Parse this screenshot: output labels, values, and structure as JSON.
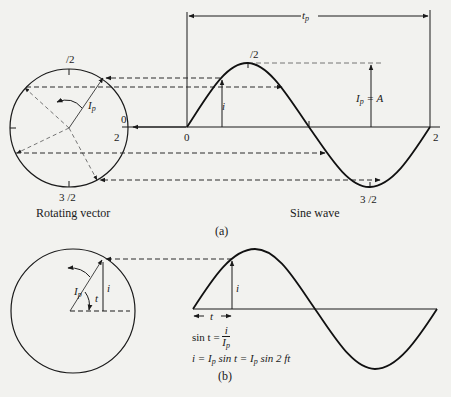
{
  "figure_a": {
    "period_label": "t",
    "period_sub": "p",
    "circle_top": "/2",
    "circle_right_top": "0",
    "circle_right_bottom": "2",
    "circle_bottom": "3 /2",
    "vector_label": "I",
    "vector_sub": "p",
    "wave_peak": "/2",
    "wave_origin": "0",
    "wave_end": "2",
    "wave_trough": "3 /2",
    "instant_label": "i",
    "amplitude_label_main": "I",
    "amplitude_label_sub": "p",
    "amplitude_label_eq": " = A",
    "left_caption": "Rotating vector",
    "right_caption": "Sine wave",
    "panel_label": "(a)"
  },
  "figure_b": {
    "vector_label": "I",
    "vector_sub": "p",
    "angle_label": "t",
    "instant_label": "i",
    "wave_instant_label": "i",
    "time_label": "t",
    "eq1_left": "sin    t = ",
    "eq1_num": "i",
    "eq1_den": "I",
    "eq1_den_sub": "p",
    "eq2_a": "i = I",
    "eq2_sub1": "p",
    "eq2_b": " sin    t = I",
    "eq2_sub2": "p",
    "eq2_c": " sin 2  ft",
    "panel_label": "(b)"
  },
  "colors": {
    "background": "#f2f2ef",
    "ink": "#1a1a1a",
    "dash": "#2a2a2a",
    "thin": "#555555"
  }
}
